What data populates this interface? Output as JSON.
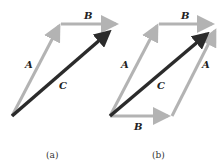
{
  "figure": {
    "panels": [
      {
        "id": "a",
        "caption": "(a)",
        "vectors": [
          {
            "name": "A",
            "label": "A",
            "from": [
              12,
              116
            ],
            "to": [
              60,
              24
            ],
            "color": "#b3b3b3"
          },
          {
            "name": "B",
            "label": "B",
            "from": [
              60,
              24
            ],
            "to": [
              120,
              24
            ],
            "color": "#b3b3b3"
          },
          {
            "name": "C",
            "label": "C",
            "from": [
              12,
              116
            ],
            "to": [
              112,
              29
            ],
            "color": "#2b2b2b"
          }
        ]
      },
      {
        "id": "b",
        "caption": "(b)",
        "vectors": [
          {
            "name": "A",
            "label": "A",
            "from": [
              110,
              116
            ],
            "to": [
              158,
              24
            ],
            "color": "#b3b3b3"
          },
          {
            "name": "B",
            "label": "B",
            "from": [
              158,
              24
            ],
            "to": [
              216,
              24
            ],
            "color": "#b3b3b3"
          },
          {
            "name": "B",
            "label": "B",
            "from": [
              110,
              116
            ],
            "to": [
              172,
              116
            ],
            "color": "#b3b3b3"
          },
          {
            "name": "A",
            "label": "A",
            "from": [
              172,
              116
            ],
            "to": [
              217,
              28
            ],
            "color": "#b3b3b3"
          },
          {
            "name": "C",
            "label": "C",
            "from": [
              110,
              116
            ],
            "to": [
              210,
              31
            ],
            "color": "#2b2b2b"
          }
        ]
      }
    ],
    "colors": {
      "component": "#b3b3b3",
      "resultant": "#2b2b2b"
    }
  }
}
